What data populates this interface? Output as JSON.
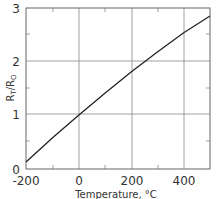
{
  "chart_data": {
    "type": "line",
    "title": "",
    "xlabel": "Temperature, °C",
    "ylabel": "RT/RO",
    "ylabel_main": "R",
    "ylabel_sub1": "T",
    "ylabel_slash": "/R",
    "ylabel_sub2": "O",
    "xlim": [
      -200,
      500
    ],
    "ylim": [
      0,
      3
    ],
    "x_ticks": [
      "-200",
      "0",
      "200",
      "400"
    ],
    "y_ticks": [
      "0",
      "1",
      "2",
      "3"
    ],
    "grid": true,
    "legend": null,
    "series": [
      {
        "name": "RT/RO",
        "x": [
          -200,
          -100,
          0,
          100,
          200,
          300,
          400,
          500
        ],
        "y": [
          0.13,
          0.58,
          1.0,
          1.41,
          1.81,
          2.18,
          2.54,
          2.85
        ]
      }
    ]
  }
}
